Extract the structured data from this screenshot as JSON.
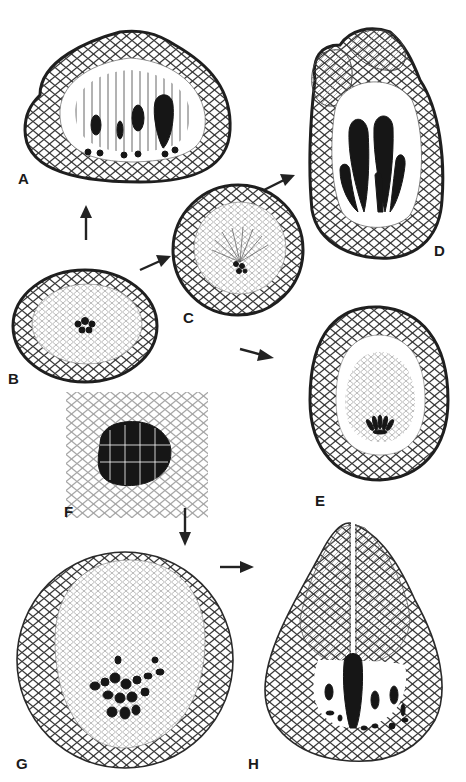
{
  "figure": {
    "panels": [
      {
        "id": "A",
        "label": "A",
        "description": "section with elongate filaments and dark club-shaped cells"
      },
      {
        "id": "B",
        "label": "B",
        "description": "elliptical section with small dark central cluster"
      },
      {
        "id": "C",
        "label": "C",
        "description": "round section with radiating filaments and dark center"
      },
      {
        "id": "D",
        "label": "D",
        "description": "elongate section with two lobed tips and large dark elongate cells"
      },
      {
        "id": "E",
        "label": "E",
        "description": "ovoid section with fan of dark cells at base"
      },
      {
        "id": "F",
        "label": "F",
        "description": "detail of dense cluster of dark cells among parenchyma"
      },
      {
        "id": "G",
        "label": "G",
        "description": "large round section with dark cell cluster"
      },
      {
        "id": "H",
        "label": "H",
        "description": "pear-shaped section with opening at top and dark elongate cells"
      }
    ],
    "arrows": [
      {
        "from": "B",
        "to": "A",
        "direction": "up"
      },
      {
        "from": "B",
        "to": "C",
        "direction": "up-right"
      },
      {
        "from": "C",
        "to": "D",
        "direction": "up-right"
      },
      {
        "from": "B",
        "to": "E",
        "direction": "right"
      },
      {
        "from": "F",
        "to": "G",
        "direction": "down"
      },
      {
        "from": "G",
        "to": "H",
        "direction": "right"
      }
    ],
    "colors": {
      "ink": "#1a1a1a",
      "background": "#ffffff"
    }
  }
}
